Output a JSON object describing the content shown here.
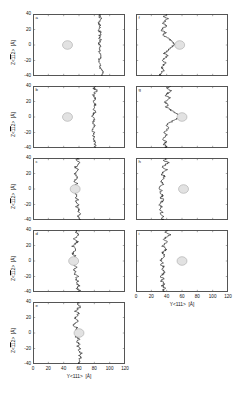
{
  "figure": {
    "axis": {
      "x_title_prefix": "Y<111>",
      "x_title_unit": "[Å]",
      "y_title_prefix_z": "Z<",
      "y_title_bar": "11",
      "y_title_suffix": "2>",
      "y_title_unit": "[Å]",
      "x_ticks": [
        "0",
        "20",
        "40",
        "60",
        "80",
        "100",
        "120"
      ],
      "y_ticks": [
        "40",
        "20",
        "0",
        "-20",
        "-40"
      ]
    },
    "colors": {
      "trace": "#1a1a1a",
      "frame": "#555555",
      "circle_fill": "#e2e2e2",
      "circle_stroke": "#9a9a9a",
      "background": "#ffffff",
      "text": "#111111"
    }
  },
  "chart_data": {
    "type": "line",
    "title": "",
    "xlabel": "Y<111> [Å]",
    "ylabel": "Z<̄1̄1 2> [Å]",
    "xlim": [
      0,
      120
    ],
    "ylim": [
      -40,
      40
    ],
    "xticks": [
      0,
      20,
      40,
      60,
      80,
      100,
      120
    ],
    "yticks": [
      -40,
      -20,
      0,
      20,
      40
    ],
    "grid": false,
    "legend": "none",
    "panel_count": 9,
    "panels": [
      {
        "label": "a",
        "column": "left",
        "row": 1,
        "marker_circle": {
          "x": 45,
          "y": 0,
          "radius_x": 6.5
        },
        "series_name": "interface profile a",
        "y": [
          40,
          37,
          34,
          31,
          28,
          25,
          22,
          19,
          16,
          13,
          10,
          7,
          4,
          1,
          -2,
          -5,
          -8,
          -11,
          -14,
          -17,
          -20,
          -23,
          -26,
          -29,
          -32,
          -35,
          -38,
          -40
        ],
        "x": [
          88,
          86.5,
          89,
          87,
          85.5,
          88.5,
          87,
          86,
          88,
          87.5,
          86.5,
          88,
          87,
          86.5,
          88,
          87,
          86,
          87.5,
          88.5,
          87,
          86,
          87.5,
          88,
          87,
          89,
          91,
          90,
          89
        ]
      },
      {
        "label": "b",
        "column": "left",
        "row": 2,
        "marker_circle": {
          "x": 45,
          "y": 0,
          "radius_x": 6.5
        },
        "series_name": "interface profile b",
        "y": [
          40,
          37,
          34,
          31,
          28,
          25,
          22,
          19,
          16,
          13,
          10,
          7,
          4,
          1,
          -2,
          -5,
          -8,
          -11,
          -14,
          -17,
          -20,
          -23,
          -26,
          -29,
          -32,
          -35,
          -38,
          -40
        ],
        "x": [
          82,
          79,
          84,
          80.5,
          78,
          82,
          80,
          79,
          81,
          80,
          78.5,
          81,
          79.5,
          78,
          80.5,
          79,
          77.5,
          80,
          78.5,
          77,
          79.5,
          78,
          80,
          79,
          81,
          80,
          82,
          81
        ]
      },
      {
        "label": "c",
        "column": "left",
        "row": 3,
        "marker_circle": {
          "x": 55,
          "y": 0,
          "radius_x": 6.5
        },
        "series_name": "interface profile c",
        "y": [
          40,
          37,
          34,
          31,
          28,
          25,
          22,
          19,
          16,
          13,
          10,
          7,
          4,
          1,
          -2,
          -5,
          -8,
          -11,
          -14,
          -17,
          -20,
          -23,
          -26,
          -29,
          -32,
          -35,
          -38,
          -40
        ],
        "x": [
          59,
          56,
          61,
          58,
          55,
          60,
          57,
          54,
          58,
          56,
          53,
          57,
          55,
          53,
          56,
          54,
          57,
          55,
          58,
          56,
          59,
          57,
          60,
          58,
          61,
          59,
          62,
          60
        ]
      },
      {
        "label": "d",
        "column": "left",
        "row": 4,
        "marker_circle": {
          "x": 53,
          "y": 0,
          "radius_x": 6.5
        },
        "series_name": "interface profile d",
        "y": [
          40,
          37,
          34,
          31,
          28,
          25,
          22,
          19,
          16,
          13,
          10,
          7,
          4,
          1,
          -2,
          -5,
          -8,
          -11,
          -14,
          -17,
          -20,
          -23,
          -26,
          -29,
          -32,
          -35,
          -38,
          -40
        ],
        "x": [
          58,
          55,
          60,
          56,
          53,
          58,
          55,
          52,
          56,
          54,
          51,
          55,
          53,
          50,
          54,
          52,
          56,
          53,
          57,
          54,
          58,
          55,
          59,
          56,
          60,
          57,
          61,
          58
        ]
      },
      {
        "label": "e",
        "column": "left",
        "row": 5,
        "marker_circle": {
          "x": 60,
          "y": 0,
          "radius_x": 6.5
        },
        "series_name": "interface profile e",
        "y": [
          40,
          37,
          34,
          31,
          28,
          25,
          22,
          19,
          16,
          13,
          10,
          7,
          4,
          1,
          -2,
          -5,
          -8,
          -11,
          -14,
          -17,
          -20,
          -23,
          -26,
          -29,
          -32,
          -35,
          -38,
          -40
        ],
        "x": [
          60,
          57,
          62,
          58,
          55,
          60,
          57,
          54,
          58,
          56,
          53,
          57,
          55,
          57,
          59,
          56,
          60,
          57,
          61,
          58,
          62,
          59,
          63,
          60,
          62,
          59,
          61,
          58
        ]
      },
      {
        "label": "f",
        "column": "right",
        "row": 1,
        "marker_circle": {
          "x": 57,
          "y": 0,
          "radius_x": 6.5
        },
        "series_name": "interface profile f",
        "y": [
          40,
          37,
          34,
          31,
          28,
          25,
          22,
          19,
          16,
          13,
          10,
          7,
          4,
          1,
          -2,
          -5,
          -8,
          -11,
          -14,
          -17,
          -20,
          -23,
          -26,
          -29,
          -32,
          -35,
          -38,
          -40
        ],
        "x": [
          40,
          36,
          42,
          38,
          34,
          40,
          36,
          33,
          38,
          35,
          40,
          44,
          48,
          50,
          47,
          43,
          40,
          37,
          41,
          38,
          35,
          39,
          36,
          33,
          37,
          34,
          31,
          33
        ]
      },
      {
        "label": "g",
        "column": "right",
        "row": 2,
        "marker_circle": {
          "x": 60,
          "y": 0,
          "radius_x": 6.5
        },
        "series_name": "interface profile g",
        "y": [
          40,
          37,
          34,
          31,
          28,
          25,
          22,
          19,
          16,
          13,
          10,
          7,
          4,
          1,
          -2,
          -5,
          -8,
          -11,
          -14,
          -17,
          -20,
          -23,
          -26,
          -29,
          -32,
          -35,
          -38,
          -40
        ],
        "x": [
          44,
          40,
          46,
          42,
          38,
          44,
          40,
          37,
          42,
          39,
          44,
          49,
          54,
          58,
          54,
          48,
          43,
          39,
          43,
          40,
          37,
          41,
          38,
          35,
          39,
          36,
          40,
          37
        ]
      },
      {
        "label": "h",
        "column": "right",
        "row": 3,
        "marker_circle": {
          "x": 62,
          "y": 0,
          "radius_x": 6.5
        },
        "series_name": "interface profile h",
        "y": [
          40,
          37,
          34,
          31,
          28,
          25,
          22,
          19,
          16,
          13,
          10,
          7,
          4,
          1,
          -2,
          -5,
          -8,
          -11,
          -14,
          -17,
          -20,
          -23,
          -26,
          -29,
          -32,
          -35,
          -38,
          -40
        ],
        "x": [
          40,
          36,
          42,
          38,
          34,
          40,
          36,
          33,
          38,
          35,
          32,
          36,
          33,
          30,
          34,
          31,
          35,
          32,
          36,
          33,
          30,
          34,
          31,
          35,
          32,
          36,
          33,
          36
        ]
      },
      {
        "label": "i",
        "column": "right",
        "row": 4,
        "marker_circle": {
          "x": 60,
          "y": 0,
          "radius_x": 6.5
        },
        "series_name": "interface profile i",
        "y": [
          40,
          37,
          34,
          31,
          28,
          25,
          22,
          19,
          16,
          13,
          10,
          7,
          4,
          1,
          -2,
          -5,
          -8,
          -11,
          -14,
          -17,
          -20,
          -23,
          -26,
          -29,
          -32,
          -35,
          -38,
          -40
        ],
        "x": [
          42,
          38,
          44,
          40,
          36,
          42,
          38,
          35,
          40,
          37,
          34,
          38,
          35,
          32,
          36,
          33,
          37,
          34,
          38,
          35,
          32,
          36,
          33,
          37,
          34,
          38,
          35,
          38
        ]
      }
    ]
  }
}
